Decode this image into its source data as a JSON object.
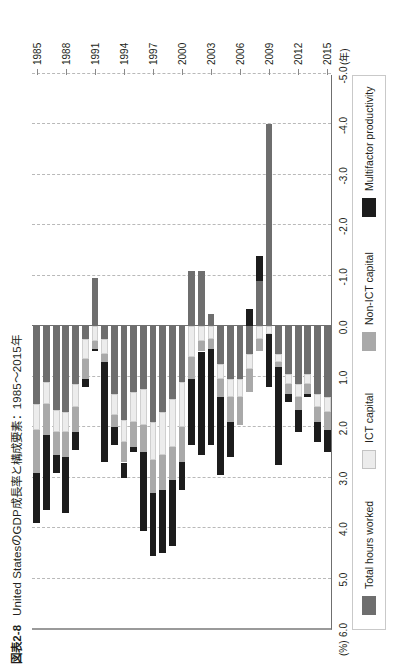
{
  "figure": {
    "number": "図表2-8",
    "title": "United StatesのGDP成長率と構成要素：1985〜2015年"
  },
  "chart_data": {
    "type": "bar",
    "orientation": "horizontal-stacked",
    "title": "United StatesのGDP成長率と構成要素：1985〜2015年",
    "xlabel": "",
    "ylabel": "(年)",
    "unit_label": "(%)",
    "value_axis_label": "(%)",
    "grid": true,
    "legend_position": "bottom",
    "xlim": [
      -5.0,
      6.0
    ],
    "value_ticks": [
      "6.0",
      "5.0",
      "4.0",
      "3.0",
      "2.0",
      "1.0",
      "0.0",
      "-1.0",
      "-2.0",
      "-3.0",
      "-4.0",
      "-5.0"
    ],
    "value_tick_numbers": [
      6.0,
      5.0,
      4.0,
      3.0,
      2.0,
      1.0,
      0.0,
      -1.0,
      -2.0,
      -3.0,
      -4.0,
      -5.0
    ],
    "categories": [
      "1985",
      "1986",
      "1987",
      "1988",
      "1989",
      "1990",
      "1991",
      "1992",
      "1993",
      "1994",
      "1995",
      "1996",
      "1997",
      "1998",
      "1999",
      "2000",
      "2001",
      "2002",
      "2003",
      "2004",
      "2005",
      "2006",
      "2007",
      "2008",
      "2009",
      "2010",
      "2011",
      "2012",
      "2013",
      "2014",
      "2015"
    ],
    "category_tick_labels": [
      "1985",
      "1988",
      "1991",
      "1994",
      "1997",
      "2000",
      "2003",
      "2006",
      "2009",
      "2012",
      "2015"
    ],
    "series": [
      {
        "name": "Total hours worked",
        "color": "#6e6e6e",
        "values": [
          1.55,
          1.1,
          1.65,
          1.7,
          1.15,
          0.25,
          -0.95,
          0.25,
          1.35,
          1.85,
          1.3,
          1.25,
          1.9,
          1.7,
          1.45,
          1.1,
          -1.1,
          -1.1,
          -0.25,
          0.75,
          1.05,
          1.05,
          0.55,
          -0.9,
          -4.0,
          0.55,
          0.95,
          1.15,
          0.95,
          1.35,
          1.4
        ]
      },
      {
        "name": "ICT capital",
        "color": "#ececec",
        "values": [
          0.5,
          0.45,
          0.45,
          0.4,
          0.45,
          0.4,
          0.3,
          0.3,
          0.4,
          0.45,
          0.6,
          0.7,
          0.75,
          0.85,
          0.95,
          0.9,
          0.6,
          0.3,
          0.25,
          0.3,
          0.35,
          0.35,
          0.3,
          0.25,
          0.15,
          0.15,
          0.2,
          0.25,
          0.2,
          0.25,
          0.3
        ]
      },
      {
        "name": "Non-ICT capital",
        "color": "#a9a9a9",
        "values": [
          0.85,
          0.6,
          0.45,
          0.5,
          0.5,
          0.4,
          0.15,
          0.15,
          0.25,
          0.4,
          0.5,
          0.55,
          0.65,
          0.7,
          0.65,
          0.7,
          0.45,
          0.2,
          0.2,
          0.35,
          0.5,
          0.55,
          0.45,
          0.25,
          0.0,
          0.1,
          0.2,
          0.25,
          0.2,
          0.3,
          0.35
        ]
      },
      {
        "name": "Multifactor productivity",
        "color": "#1c1c1c",
        "values": [
          1.0,
          1.5,
          0.35,
          1.1,
          0.35,
          0.15,
          0.05,
          2.0,
          0.35,
          0.3,
          0.1,
          1.55,
          1.25,
          1.25,
          1.3,
          0.55,
          1.3,
          2.05,
          1.9,
          1.55,
          0.7,
          0.0,
          -0.35,
          -0.5,
          1.05,
          1.95,
          0.15,
          0.45,
          0.05,
          0.4,
          0.45
        ]
      }
    ]
  },
  "legend": {
    "items": [
      {
        "label": "Total hours worked",
        "color": "#6e6e6e"
      },
      {
        "label": "ICT capital",
        "color": "#ececec"
      },
      {
        "label": "Non-ICT capital",
        "color": "#a9a9a9"
      },
      {
        "label": "Multifactor productivity",
        "color": "#1c1c1c"
      }
    ]
  }
}
